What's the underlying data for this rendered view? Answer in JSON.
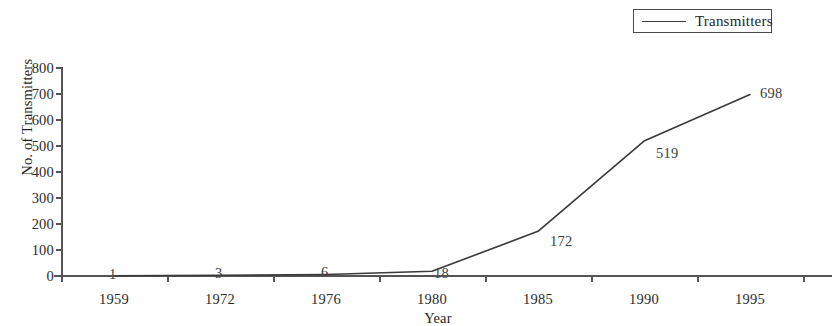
{
  "legend": {
    "entries": [
      {
        "label": "Transmitters",
        "marker": "line-sample",
        "color": "#3a3a3a"
      }
    ]
  },
  "axes": {
    "x_title": "Year",
    "y_title": "No. of Transmitters"
  },
  "chart_data": {
    "type": "line",
    "title": "",
    "subtitle": "",
    "xlabel": "Year",
    "ylabel": "No. of Transmitters",
    "categories": [
      "1959",
      "1972",
      "1976",
      "1980",
      "1985",
      "1990",
      "1995"
    ],
    "series": [
      {
        "name": "Transmitters",
        "color": "#3a3a3a",
        "values": [
          1,
          3,
          6,
          18,
          172,
          519,
          698
        ],
        "point_labels": [
          "1",
          "3",
          "6",
          "18",
          "172",
          "519",
          "698"
        ]
      }
    ],
    "ylim": [
      0,
      800
    ],
    "ytick_labels": [
      "800",
      "700",
      "600",
      "500",
      "400",
      "300",
      "200",
      "100",
      "0"
    ],
    "ytick_values": [
      800,
      700,
      600,
      500,
      400,
      300,
      200,
      100,
      0
    ],
    "ytick_step": 100,
    "grid": false,
    "legend_position": "top-right"
  }
}
